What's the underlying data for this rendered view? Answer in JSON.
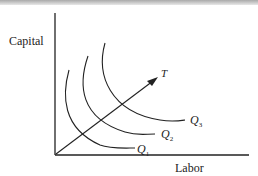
{
  "diagram": {
    "type": "isoquant map with expansion path",
    "y_axis_label": "Capital",
    "x_axis_label": "Labor",
    "ray_label": "T",
    "isoquants": [
      {
        "name": "Q",
        "sub": "1"
      },
      {
        "name": "Q",
        "sub": "2"
      },
      {
        "name": "Q",
        "sub": "3"
      }
    ],
    "colors": {
      "line": "#222222",
      "background": "#ffffff"
    }
  }
}
